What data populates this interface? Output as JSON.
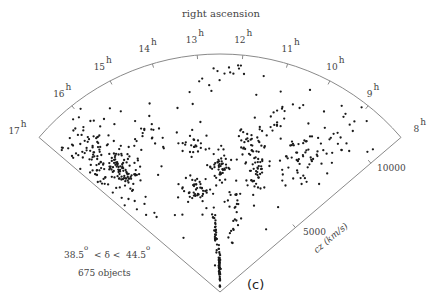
{
  "chart_data": {
    "type": "scatter",
    "subtype": "polar-wedge (redshift survey slice)",
    "title": "right ascension",
    "angular_axis": {
      "label": "right ascension",
      "unit": "h",
      "ticks": [
        "17",
        "16",
        "15",
        "14",
        "13",
        "12",
        "11",
        "10",
        "9",
        "8"
      ],
      "range_hours": [
        8,
        17
      ]
    },
    "radial_axis": {
      "label": "cz (km/s)",
      "ticks": [
        5000,
        10000
      ],
      "range": [
        0,
        12000
      ]
    },
    "annotations": {
      "declination_range": {
        "low": "38.5",
        "high": "44.5",
        "symbol": "δ",
        "unit": "o"
      },
      "object_count_label": "675 objects",
      "panel_label": "(c)"
    },
    "n_points": 675,
    "clusters": [
      {
        "ra_h": 16.3,
        "cz": 9000,
        "ra_sd": 0.35,
        "cz_sd": 1200,
        "n": 120
      },
      {
        "ra_h": 16.0,
        "cz": 8000,
        "ra_sd": 0.25,
        "cz_sd": 600,
        "n": 60
      },
      {
        "ra_h": 14.7,
        "cz": 8700,
        "ra_sd": 0.25,
        "cz_sd": 400,
        "n": 18
      },
      {
        "ra_h": 13.4,
        "cz": 7500,
        "ra_sd": 0.25,
        "cz_sd": 350,
        "n": 22
      },
      {
        "ra_h": 13.7,
        "cz": 5300,
        "ra_sd": 0.35,
        "cz_sd": 300,
        "n": 45
      },
      {
        "ra_h": 12.5,
        "cz": 6300,
        "ra_sd": 0.25,
        "cz_sd": 300,
        "n": 40
      },
      {
        "ra_h": 12.6,
        "cz": 1200,
        "ra_sd": 0.1,
        "cz_sd": 500,
        "n": 55
      },
      {
        "ra_h": 12.9,
        "cz": 3000,
        "ra_sd": 0.08,
        "cz_sd": 600,
        "n": 30
      },
      {
        "ra_h": 11.4,
        "cz": 7500,
        "ra_sd": 0.3,
        "cz_sd": 500,
        "n": 40
      },
      {
        "ra_h": 11.0,
        "cz": 6200,
        "ra_sd": 0.2,
        "cz_sd": 600,
        "n": 35
      },
      {
        "ra_h": 10.8,
        "cz": 9600,
        "ra_sd": 0.15,
        "cz_sd": 500,
        "n": 16
      },
      {
        "ra_h": 11.6,
        "cz": 4000,
        "ra_sd": 0.25,
        "cz_sd": 700,
        "n": 25
      },
      {
        "ra_h": 9.6,
        "cz": 8000,
        "ra_sd": 0.4,
        "cz_sd": 700,
        "n": 60
      },
      {
        "ra_h": 9.1,
        "cz": 10500,
        "ra_sd": 0.3,
        "cz_sd": 900,
        "n": 14
      },
      {
        "ra_h": 12.0,
        "cz": 11200,
        "ra_sd": 0.2,
        "cz_sd": 500,
        "n": 10
      }
    ],
    "background_points": 80,
    "grid": false,
    "legend": null
  },
  "style": {
    "line_color": "#8a8a8a",
    "point_color": "#1a1a1a",
    "label_color": "#444444"
  }
}
